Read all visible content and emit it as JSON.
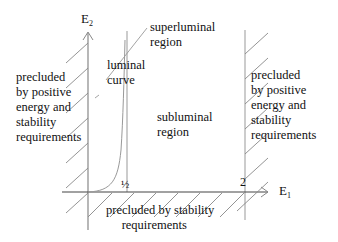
{
  "diagram": {
    "axes": {
      "y_label": "E",
      "y_label_sub": "2",
      "x_label": "E",
      "x_label_sub": "1"
    },
    "ticks": {
      "half": "½",
      "two": "2"
    },
    "regions": {
      "superluminal": "superluminal\nregion",
      "luminal": "luminal\ncurve",
      "subluminal": "subluminal\nregion",
      "left_precluded": "precluded\nby positive\nenergy and\nstability\nrequirements",
      "right_precluded": "precluded\nby positive\nenergy and\nstability\nrequirements",
      "bottom_precluded": "precluded by stability\n     requirements"
    },
    "colors": {
      "line": "#999999",
      "axis": "#444444",
      "text": "#111111"
    }
  }
}
